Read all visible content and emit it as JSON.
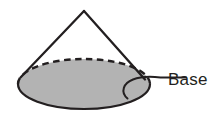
{
  "figure": {
    "name": "cone-with-labeled-base",
    "background_color": "#ffffff",
    "labels": [
      {
        "id": "base",
        "text": "Base",
        "color": "#231f20",
        "x": 168,
        "y": 85
      }
    ],
    "shape": {
      "type": "cone",
      "apex": {
        "x": 84,
        "y": 11
      },
      "base_ellipse": {
        "center_x": 84,
        "center_y": 84,
        "radius_x": 66,
        "radius_y": 25,
        "fill_color": "#b3b3b3",
        "stroke_color": "#231f20",
        "stroke_width": 2,
        "hidden_edge_style": "dashed",
        "visible_edge_style": "solid"
      },
      "slant_edges": [
        {
          "from_x": 84,
          "from_y": 11,
          "to_x": 21,
          "to_y": 77
        },
        {
          "from_x": 84,
          "from_y": 11,
          "to_x": 144,
          "to_y": 79
        }
      ]
    },
    "leader_line": {
      "color": "#231f20",
      "stroke_width": 2,
      "anchor_x": 127,
      "anchor_y": 98,
      "end_x": 186,
      "end_y": 78
    }
  }
}
